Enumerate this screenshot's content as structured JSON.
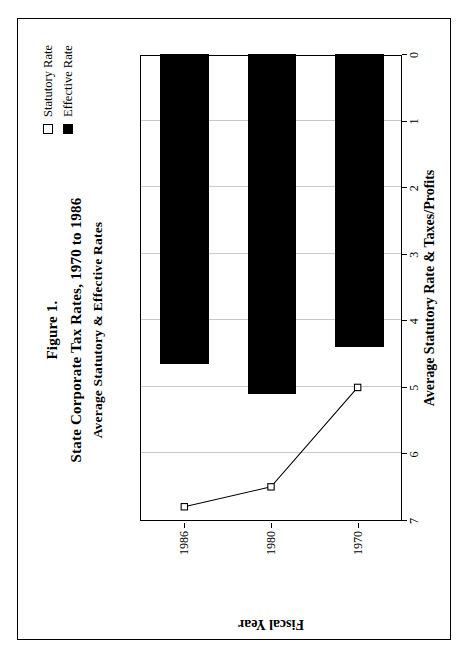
{
  "figure": {
    "title_line1": "Figure 1.",
    "title_line2": "State Corporate Tax Rates, 1970 to 1986",
    "title_line3": "Average Statutory & Effective Rates"
  },
  "legend": {
    "items": [
      {
        "label": "Statutory Rate",
        "marker": "open-square",
        "color": "#ffffff"
      },
      {
        "label": "Effective Rate",
        "marker": "filled-square",
        "color": "#000000"
      }
    ]
  },
  "chart_data": {
    "type": "bar",
    "orientation": "horizontal",
    "title": "State Corporate Tax Rates, 1970 to 1986",
    "subtitle": "Average Statutory & Effective Rates",
    "figure_number": "Figure 1.",
    "categories": [
      "1970",
      "1980",
      "1986"
    ],
    "xlabel": "Average Statutory Rate & Taxes/Profits",
    "ylabel": "Fiscal Year",
    "xlim": [
      7,
      0
    ],
    "x_reversed": true,
    "xticks": [
      "7",
      "6",
      "5",
      "4",
      "3",
      "2",
      "1",
      "0"
    ],
    "xtick_values": [
      7,
      6,
      5,
      4,
      3,
      2,
      1,
      0
    ],
    "grid": true,
    "legend_position": "top-right",
    "series": [
      {
        "name": "Statutory Rate",
        "type": "line",
        "marker": "open-square",
        "color": "#000000",
        "values": [
          5.0,
          6.5,
          6.8
        ]
      },
      {
        "name": "Effective Rate",
        "type": "bar",
        "color": "#000000",
        "values": [
          4.4,
          5.1,
          4.65
        ]
      }
    ]
  }
}
